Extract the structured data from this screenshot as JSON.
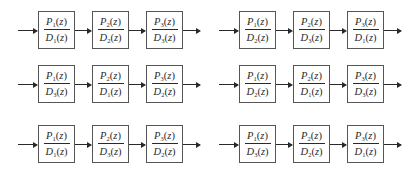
{
  "figure": {
    "variable": "z",
    "diagrams": [
      {
        "id": "row1-left",
        "blocks": [
          {
            "num": "P",
            "num_sub": "1",
            "den": "D",
            "den_sub": "1"
          },
          {
            "num": "P",
            "num_sub": "2",
            "den": "D",
            "den_sub": "2"
          },
          {
            "num": "P",
            "num_sub": "3",
            "den": "D",
            "den_sub": "3"
          }
        ]
      },
      {
        "id": "row1-right",
        "blocks": [
          {
            "num": "P",
            "num_sub": "1",
            "den": "D",
            "den_sub": "2"
          },
          {
            "num": "P",
            "num_sub": "2",
            "den": "D",
            "den_sub": "3"
          },
          {
            "num": "P",
            "num_sub": "3",
            "den": "D",
            "den_sub": "1"
          }
        ]
      },
      {
        "id": "row2-left",
        "blocks": [
          {
            "num": "P",
            "num_sub": "1",
            "den": "D",
            "den_sub": "3"
          },
          {
            "num": "P",
            "num_sub": "2",
            "den": "D",
            "den_sub": "1"
          },
          {
            "num": "P",
            "num_sub": "3",
            "den": "D",
            "den_sub": "2"
          }
        ]
      },
      {
        "id": "row2-right",
        "blocks": [
          {
            "num": "P",
            "num_sub": "1",
            "den": "D",
            "den_sub": "2"
          },
          {
            "num": "P",
            "num_sub": "2",
            "den": "D",
            "den_sub": "1"
          },
          {
            "num": "P",
            "num_sub": "3",
            "den": "D",
            "den_sub": "3"
          }
        ]
      },
      {
        "id": "row3-left",
        "blocks": [
          {
            "num": "P",
            "num_sub": "1",
            "den": "D",
            "den_sub": "1"
          },
          {
            "num": "P",
            "num_sub": "2",
            "den": "D",
            "den_sub": "3"
          },
          {
            "num": "P",
            "num_sub": "3",
            "den": "D",
            "den_sub": "2"
          }
        ]
      },
      {
        "id": "row3-right",
        "blocks": [
          {
            "num": "P",
            "num_sub": "1",
            "den": "D",
            "den_sub": "3"
          },
          {
            "num": "P",
            "num_sub": "2",
            "den": "D",
            "den_sub": "2"
          },
          {
            "num": "P",
            "num_sub": "3",
            "den": "D",
            "den_sub": "1"
          }
        ]
      }
    ]
  },
  "symbols": {
    "open_paren": "(",
    "close_paren": ")",
    "z": "z"
  },
  "colors": {
    "line": "#2a2a2a",
    "box_border": "#555555",
    "background": "#ffffff"
  }
}
